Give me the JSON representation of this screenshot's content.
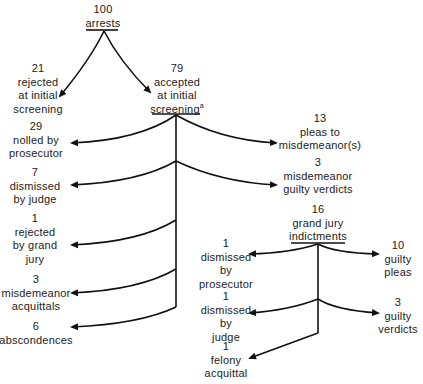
{
  "diagram": {
    "type": "flow-tree",
    "nodes": {
      "arrests": {
        "count": "100",
        "lines": [
          "arrests"
        ]
      },
      "rejected_screening": {
        "count": "21",
        "lines": [
          "rejected",
          "at initial",
          "screening"
        ]
      },
      "accepted_screening": {
        "count": "79",
        "lines": [
          "accepted",
          "at initial",
          "screening"
        ],
        "footnote": "a"
      },
      "nolled": {
        "count": "29",
        "lines": [
          "nolled by",
          "prosecutor"
        ]
      },
      "dismissed_judge": {
        "count": "7",
        "lines": [
          "dismissed",
          "by judge"
        ]
      },
      "rejected_grand_jury": {
        "count": "1",
        "lines": [
          "rejected",
          "by grand",
          "jury"
        ]
      },
      "misdemeanor_acquittals": {
        "count": "3",
        "lines": [
          "misdemeanor",
          "acquittals"
        ]
      },
      "abscondences": {
        "count": "6",
        "lines": [
          "abscondences"
        ]
      },
      "pleas_misdemeanor": {
        "count": "13",
        "lines": [
          "pleas to",
          "misdemeanor(s)"
        ]
      },
      "misdemeanor_guilty": {
        "count": "3",
        "lines": [
          "misdemeanor",
          "guilty verdicts"
        ]
      },
      "indictments": {
        "count": "16",
        "lines": [
          "grand jury",
          "indictments"
        ]
      },
      "ind_dismissed_prosecutor": {
        "count": "1",
        "lines": [
          "dismissed",
          "by",
          "prosecutor"
        ]
      },
      "ind_dismissed_judge": {
        "count": "1",
        "lines": [
          "dismissed",
          "by",
          "judge"
        ]
      },
      "felony_acquittal": {
        "count": "1",
        "lines": [
          "felony",
          "acquittal"
        ]
      },
      "guilty_pleas": {
        "count": "10",
        "lines": [
          "guilty",
          "pleas"
        ]
      },
      "guilty_verdicts": {
        "count": "3",
        "lines": [
          "guilty",
          "verdicts"
        ]
      }
    },
    "edges": [
      [
        "arrests",
        "rejected_screening"
      ],
      [
        "arrests",
        "accepted_screening"
      ],
      [
        "accepted_screening",
        "nolled"
      ],
      [
        "accepted_screening",
        "pleas_misdemeanor"
      ],
      [
        "accepted_screening",
        "dismissed_judge"
      ],
      [
        "accepted_screening",
        "misdemeanor_guilty"
      ],
      [
        "accepted_screening",
        "rejected_grand_jury"
      ],
      [
        "accepted_screening",
        "indictments"
      ],
      [
        "accepted_screening",
        "misdemeanor_acquittals"
      ],
      [
        "accepted_screening",
        "abscondences"
      ],
      [
        "indictments",
        "ind_dismissed_prosecutor"
      ],
      [
        "indictments",
        "guilty_pleas"
      ],
      [
        "indictments",
        "ind_dismissed_judge"
      ],
      [
        "indictments",
        "guilty_verdicts"
      ],
      [
        "indictments",
        "felony_acquittal"
      ]
    ],
    "line_color": "#111111"
  }
}
